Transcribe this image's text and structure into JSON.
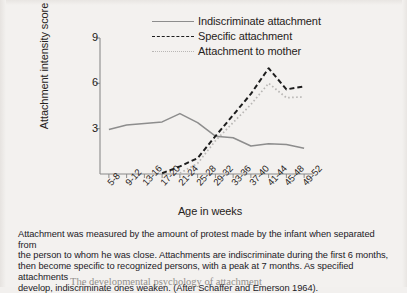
{
  "figure": {
    "ylabel": "Attachment intensity score",
    "xlabel": "Age in weeks",
    "caption_line1": "Attachment was measured by the amount of protest made by the infant when separated from",
    "caption_line2": "the person to whom he was close. Attachments are indiscriminate during the first 6 months,",
    "caption_line3": "then become specific to recognized persons, with a peak at 7 months. As specified attachments",
    "caption_line4": "develop, indiscriminate ones weaken. (After Schaffer and Emerson 1964).",
    "page_bleed_text": "The developmental psychology of attachment"
  },
  "colors": {
    "indiscriminate": "#8d8d8d",
    "specific": "#1d1d1d",
    "mother": "#b9b7b5",
    "axis": "#8a8a8a",
    "paper": "#f3f1ef"
  },
  "chart_data": {
    "type": "line",
    "title": "",
    "xlabel": "Age in weeks",
    "ylabel": "Attachment intensity score",
    "ylim": [
      0,
      9
    ],
    "yticks": [
      3,
      6,
      9
    ],
    "grid": false,
    "legend_position": "top-center",
    "categories": [
      "5-8",
      "9-12",
      "13-16",
      "17-20",
      "21-24",
      "25-28",
      "29-32",
      "33-36",
      "37-40",
      "41-44",
      "45-48",
      "49-52"
    ],
    "series": [
      {
        "name": "Indiscriminate attachment",
        "style": "solid",
        "color": "#8d8d8d",
        "values": [
          2.95,
          3.25,
          3.35,
          3.45,
          4.0,
          3.4,
          2.5,
          2.4,
          1.85,
          2.0,
          1.95,
          1.7
        ]
      },
      {
        "name": "Specific attachment",
        "style": "dashed",
        "color": "#1d1d1d",
        "values": [
          null,
          null,
          null,
          0.05,
          0.5,
          1.05,
          2.5,
          3.9,
          5.3,
          7.0,
          5.6,
          5.8
        ]
      },
      {
        "name": "Attachment to mother",
        "style": "dotted",
        "color": "#b9b7b5",
        "values": [
          null,
          null,
          null,
          null,
          0.05,
          0.7,
          2.2,
          3.4,
          4.6,
          6.0,
          5.05,
          5.1
        ]
      }
    ]
  }
}
